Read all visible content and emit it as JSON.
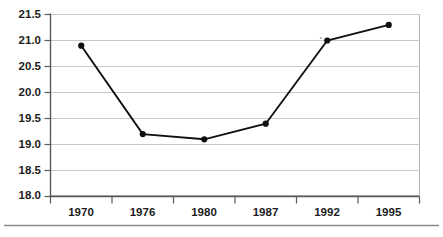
{
  "chart_data": {
    "type": "line",
    "title": "",
    "subtitle": "",
    "xlabel": "",
    "ylabel": "",
    "categories": [
      "1970",
      "1976",
      "1980",
      "1987",
      "1992",
      "1995"
    ],
    "values": [
      20.9,
      19.2,
      19.1,
      19.4,
      21.0,
      21.3
    ],
    "series": [
      {
        "name": "",
        "values": [
          20.9,
          19.2,
          19.1,
          19.4,
          21.0,
          21.3
        ]
      }
    ],
    "ylim": [
      18.0,
      21.5
    ],
    "ytick_labels": [
      "18.0",
      "18.5",
      "19.0",
      "19.5",
      "20.0",
      "20.5",
      "21.0",
      "21.5"
    ],
    "ytick_values": [
      18.0,
      18.5,
      19.0,
      19.5,
      20.0,
      20.5,
      21.0,
      21.5
    ],
    "grid": true,
    "grid_axis": "y",
    "legend": false,
    "legend_position": "none",
    "marker": "filled-circle",
    "line_color": "#101010",
    "marker_color": "#101010",
    "gridline_color": "#c9c9c9",
    "axis_color": "#5a5a5a",
    "background_color": "#ffffff",
    "annotations": []
  },
  "figure": {
    "bottom_rule": true
  }
}
